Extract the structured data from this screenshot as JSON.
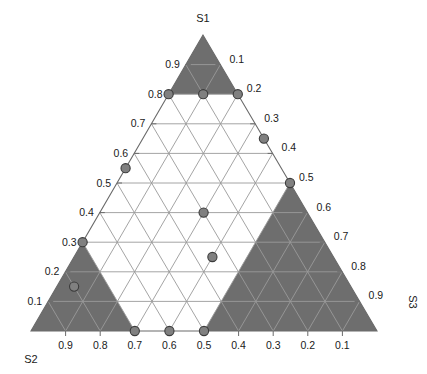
{
  "chart_data": {
    "type": "scatter",
    "subtype": "ternary-simplex",
    "title": "",
    "axes": [
      {
        "id": "S1",
        "label": "S1",
        "position": "apex-top",
        "tick_side": "left",
        "ticks": [
          0.9,
          0.8,
          0.7,
          0.6,
          0.5,
          0.4,
          0.3,
          0.2,
          0.1
        ]
      },
      {
        "id": "S2",
        "label": "S2",
        "position": "vertex-bottom-left",
        "tick_side": "bottom",
        "ticks": [
          0.9,
          0.8,
          0.7,
          0.6,
          0.5,
          0.4,
          0.3,
          0.2,
          0.1
        ]
      },
      {
        "id": "S3",
        "label": "S3",
        "position": "vertex-bottom-right",
        "tick_side": "right",
        "ticks": [
          0.1,
          0.2,
          0.3,
          0.4,
          0.5,
          0.6,
          0.7,
          0.8,
          0.9
        ]
      }
    ],
    "grid": true,
    "grid_step": 0.1,
    "legend": "none",
    "points": [
      {
        "s1": 0.8,
        "s2": 0.2,
        "s3": 0.0
      },
      {
        "s1": 0.8,
        "s2": 0.1,
        "s3": 0.1
      },
      {
        "s1": 0.8,
        "s2": 0.0,
        "s3": 0.2
      },
      {
        "s1": 0.65,
        "s2": 0.0,
        "s3": 0.35
      },
      {
        "s1": 0.55,
        "s2": 0.45,
        "s3": 0.0
      },
      {
        "s1": 0.5,
        "s2": 0.0,
        "s3": 0.5
      },
      {
        "s1": 0.4,
        "s2": 0.3,
        "s3": 0.3
      },
      {
        "s1": 0.3,
        "s2": 0.7,
        "s3": 0.0
      },
      {
        "s1": 0.25,
        "s2": 0.35,
        "s3": 0.4
      },
      {
        "s1": 0.15,
        "s2": 0.8,
        "s3": 0.05
      },
      {
        "s1": 0.0,
        "s2": 0.7,
        "s3": 0.3
      },
      {
        "s1": 0.0,
        "s2": 0.6,
        "s3": 0.4
      },
      {
        "s1": 0.0,
        "s2": 0.5,
        "s3": 0.5
      }
    ],
    "shaded_regions": [
      {
        "name": "s1-corner-region",
        "vertex": "S1",
        "threshold": 0.8
      },
      {
        "name": "s2-corner-region",
        "vertex": "S2",
        "threshold": 0.7
      },
      {
        "name": "s3-corner-region",
        "vertex": "S3",
        "threshold": 0.5
      }
    ]
  },
  "labels": {
    "s1": "S1",
    "s2": "S2",
    "s3": "S3"
  },
  "ticks": {
    "left": [
      "0.9",
      "0.8",
      "0.7",
      "0.6",
      "0.5",
      "0.4",
      "0.3",
      "0.2",
      "0.1"
    ],
    "right": [
      "0.1",
      "0.2",
      "0.3",
      "0.4",
      "0.5",
      "0.6",
      "0.7",
      "0.8",
      "0.9"
    ],
    "bottom": [
      "0.9",
      "0.8",
      "0.7",
      "0.6",
      "0.5",
      "0.4",
      "0.3",
      "0.2",
      "0.1"
    ]
  },
  "colors": {
    "shaded_region": "#6e6e6e",
    "grid_line": "#9a9a9a",
    "outline": "#6a6a6a",
    "point_fill": "#808080",
    "point_stroke": "#3c3c3c",
    "text": "#1a1a1a",
    "background": "#ffffff"
  }
}
